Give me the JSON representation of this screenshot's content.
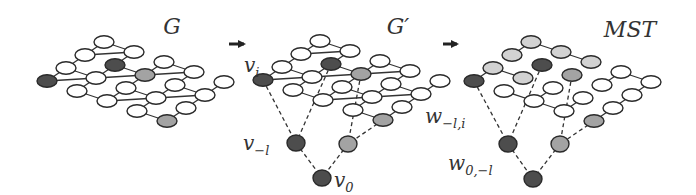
{
  "colors": {
    "dark": "#4d4d4d",
    "gray": "#a3a3a3",
    "light": "#d2d2d2",
    "white": "#ffffff",
    "stroke": "#2a2a2a"
  },
  "lattice": {
    "cols": 5,
    "rows": 4,
    "vec_c": [
      30,
      10
    ],
    "vec_r": [
      -19,
      13
    ],
    "rx": 10,
    "ry": 6.2
  },
  "panels": [
    {
      "id": "G",
      "title": "G",
      "title_pos": [
        172,
        34
      ],
      "origin": [
        104,
        42
      ],
      "full_lattice": true,
      "node_colors": {
        "1,1": "dark",
        "0,3": "dark",
        "2,1": "gray",
        "4,3": "gray"
      },
      "tree_edges": [],
      "extra_nodes": [],
      "dashed_edges": [],
      "labels": []
    },
    {
      "id": "G-prime",
      "title": "G′",
      "title_pos": [
        398,
        34
      ],
      "origin": [
        320,
        41
      ],
      "full_lattice": true,
      "node_colors": {
        "1,1": "dark",
        "0,3": "dark",
        "2,1": "gray",
        "4,3": "gray"
      },
      "tree_edges": [],
      "extra_nodes": [
        {
          "id": "v_-l",
          "x": 296,
          "y": 143,
          "color": "dark"
        },
        {
          "id": "g1",
          "x": 348,
          "y": 144,
          "color": "gray"
        },
        {
          "id": "v_0",
          "x": 322,
          "y": 178,
          "color": "dark"
        }
      ],
      "dashed_edges": [
        [
          [
            263,
            80
          ],
          [
            296,
            143
          ]
        ],
        [
          [
            331,
            64
          ],
          [
            296,
            143
          ]
        ],
        [
          [
            361,
            74
          ],
          [
            348,
            144
          ]
        ],
        [
          [
            383,
            120
          ],
          [
            348,
            144
          ]
        ],
        [
          [
            296,
            143
          ],
          [
            322,
            178
          ]
        ],
        [
          [
            348,
            144
          ],
          [
            322,
            178
          ]
        ]
      ],
      "labels": [
        {
          "text": "v",
          "sub": "i",
          "x": 244,
          "y": 72
        },
        {
          "text": "v",
          "sub": "−l",
          "x": 243,
          "y": 150
        },
        {
          "text": "v",
          "sub": "0",
          "x": 334,
          "y": 187
        }
      ]
    },
    {
      "id": "MST",
      "title": "MST",
      "title_pos": [
        630,
        37
      ],
      "origin": [
        531,
        42
      ],
      "full_lattice": false,
      "node_colors": {
        "0,0": "light",
        "1,0": "light",
        "2,0": "light",
        "0,1": "light",
        "0,2": "light",
        "1,2": "light",
        "1,1": "dark",
        "0,3": "dark",
        "2,1": "gray",
        "4,3": "gray",
        "1,3": "white",
        "2,2": "white",
        "2,3": "white",
        "3,2": "white",
        "3,3": "white",
        "3,0": "white",
        "4,0": "white",
        "3,1": "white",
        "4,1": "white",
        "4,2": "white"
      },
      "tree_edges": [
        [
          "0,0",
          "0,1"
        ],
        [
          "0,0",
          "1,0"
        ],
        [
          "1,0",
          "2,0"
        ],
        [
          "0,3",
          "0,2"
        ],
        [
          "0,2",
          "1,2"
        ],
        [
          "1,3",
          "2,3"
        ],
        [
          "2,3",
          "2,2"
        ],
        [
          "2,3",
          "3,3"
        ],
        [
          "3,3",
          "3,2"
        ],
        [
          "3,1",
          "3,0"
        ],
        [
          "3,0",
          "4,0"
        ],
        [
          "4,0",
          "4,1"
        ],
        [
          "4,1",
          "4,2"
        ],
        [
          "4,2",
          "4,3"
        ]
      ],
      "extra_nodes": [
        {
          "id": "w1",
          "x": 508,
          "y": 144,
          "color": "dark"
        },
        {
          "id": "w2",
          "x": 560,
          "y": 144,
          "color": "gray"
        },
        {
          "id": "w3",
          "x": 533,
          "y": 179,
          "color": "dark"
        }
      ],
      "dashed_edges": [
        [
          [
            474,
            81
          ],
          [
            508,
            144
          ]
        ],
        [
          [
            542,
            65
          ],
          [
            508,
            144
          ]
        ],
        [
          [
            572,
            75
          ],
          [
            560,
            144
          ]
        ],
        [
          [
            594,
            121
          ],
          [
            560,
            144
          ]
        ],
        [
          [
            508,
            144
          ],
          [
            533,
            179
          ]
        ],
        [
          [
            560,
            144
          ],
          [
            533,
            179
          ]
        ]
      ],
      "labels": [
        {
          "text": "w",
          "sub": "−l,i",
          "x": 425,
          "y": 123
        },
        {
          "text": "w",
          "sub": "0,−l",
          "x": 448,
          "y": 170
        }
      ]
    }
  ],
  "arrows": [
    {
      "x1": 229,
      "y1": 44,
      "x2": 250,
      "y2": 44
    },
    {
      "x1": 443,
      "y1": 44,
      "x2": 463,
      "y2": 44
    }
  ]
}
